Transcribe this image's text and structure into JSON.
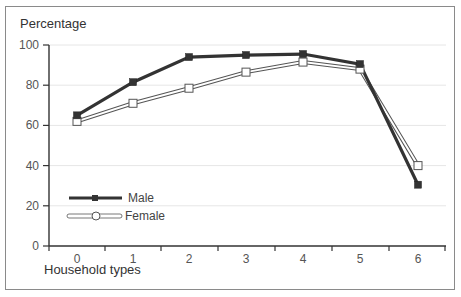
{
  "chart_data": {
    "type": "line",
    "title": "",
    "ylabel": "Percentage",
    "xlabel": "Household types",
    "x": [
      0,
      1,
      2,
      3,
      4,
      5,
      6
    ],
    "categories": [
      "0",
      "1",
      "2",
      "3",
      "4",
      "5",
      "6"
    ],
    "ylim": [
      0,
      100
    ],
    "yticks": [
      0,
      20,
      40,
      60,
      80,
      100
    ],
    "grid": true,
    "legend_position": "lower left",
    "series": [
      {
        "name": "Male",
        "marker": "filled-square",
        "color": "#333333",
        "values": [
          65,
          81.5,
          94,
          95,
          95.5,
          90.5,
          30.5
        ]
      },
      {
        "name": "Female",
        "marker": "open-square",
        "color": "#ffffff",
        "values": [
          62,
          71,
          78.5,
          86.5,
          91.5,
          88,
          40
        ]
      }
    ]
  },
  "labels": {
    "ylabel": "Percentage",
    "xlabel": "Household types",
    "legend_male": "Male",
    "legend_female": "Female"
  }
}
